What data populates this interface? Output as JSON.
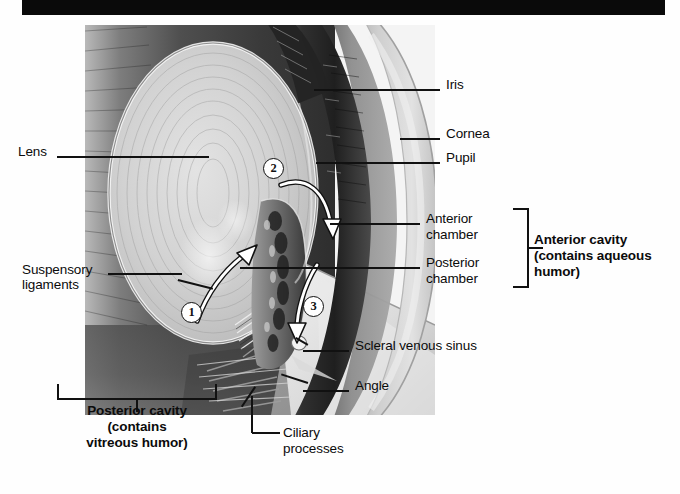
{
  "figure": {
    "title_bar_color": "#0a0a0a"
  },
  "labels": {
    "lens": "Lens",
    "suspensory_ligaments_line1": "Suspensory",
    "suspensory_ligaments_line2": "ligaments",
    "iris": "Iris",
    "cornea": "Cornea",
    "pupil": "Pupil",
    "anterior_chamber_line1": "Anterior",
    "anterior_chamber_line2": "chamber",
    "posterior_chamber_line1": "Posterior",
    "posterior_chamber_line2": "chamber",
    "anterior_cavity_line1": "Anterior cavity",
    "anterior_cavity_line2": "(contains aqueous",
    "anterior_cavity_line3": "humor)",
    "scleral_venous_sinus": "Scleral venous sinus",
    "angle": "Angle",
    "ciliary_processes_line1": "Ciliary",
    "ciliary_processes_line2": "processes",
    "posterior_cavity_line1": "Posterior cavity",
    "posterior_cavity_line2": "(contains",
    "posterior_cavity_line3": "vitreous humor)"
  },
  "markers": [
    {
      "id": "marker-1",
      "number": "1"
    },
    {
      "id": "marker-2",
      "number": "2"
    },
    {
      "id": "marker-3",
      "number": "3"
    }
  ],
  "colors": {
    "ink": "#111111",
    "paper": "#fefefe",
    "bar": "#0a0a0a",
    "sclera": "#d8d8d8",
    "cornea": "#c9c9c9",
    "anterior_chamber": "#9e9e9e",
    "iris_dark": "#2c2c2c",
    "lens_light": "#d5d5d5",
    "vitreous_dark": "#4a4a4a",
    "arrow_white": "#ffffff"
  }
}
